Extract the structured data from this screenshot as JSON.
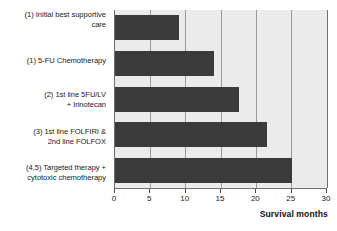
{
  "chart_data": {
    "type": "bar",
    "orientation": "horizontal",
    "title": "",
    "subtitle": "",
    "xlabel": "Survival months",
    "ylabel": "",
    "xlim": [
      0,
      30
    ],
    "xticks": [
      0,
      5,
      10,
      15,
      20,
      25,
      30
    ],
    "grid": true,
    "legend": false,
    "legend_position": "none",
    "bar_color": "#3b3b3b",
    "plot_background": "#ebebeb",
    "gridline_color": "#9a9a9a",
    "axis_color": "#6f6f6f",
    "categories": [
      "(1) Initial best supportive care",
      "(1)  5-FU Chemotherapy",
      "(2) 1st line 5FU/LV + Irinotecan",
      "(3) 1st line FOLFIRI & 2nd line FOLFOX",
      "(4,5) Targeted therapy + cytotoxic chemotherapy"
    ],
    "category_lines": [
      [
        "(1) Initial best supportive",
        "care"
      ],
      [
        "(1)  5-FU Chemotherapy"
      ],
      [
        "(2) 1st line 5FU/LV",
        "+ Irinotecan"
      ],
      [
        "(3) 1st line FOLFIRI &",
        "2nd line FOLFOX"
      ],
      [
        "(4,5) Targeted therapy +",
        "cytotoxic chemotherapy"
      ]
    ],
    "values": [
      9,
      14,
      17.5,
      21.5,
      25
    ]
  }
}
